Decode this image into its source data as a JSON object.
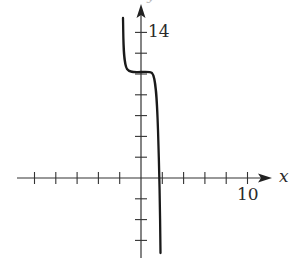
{
  "chart_data": {
    "type": "line",
    "title": "",
    "xlabel": "x",
    "ylabel": "y",
    "xlim": [
      -12,
      12
    ],
    "ylim": [
      -8,
      16
    ],
    "x_tick_step": 2,
    "y_tick_step": 2,
    "labeled_ticks": {
      "x": [
        10
      ],
      "y": [
        14
      ]
    },
    "grid": false,
    "legend": null,
    "series": [
      {
        "name": "curve",
        "description": "decreasing cubic-like curve with a horizontal plateau (inflection) near y=10, crossing the x-axis near x=2",
        "points": [
          {
            "x": -1.6,
            "y": 15.5
          },
          {
            "x": -1.5,
            "y": 12.0
          },
          {
            "x": -1.2,
            "y": 10.4
          },
          {
            "x": -0.5,
            "y": 10.1
          },
          {
            "x": 0.5,
            "y": 10.0
          },
          {
            "x": 1.0,
            "y": 9.9
          },
          {
            "x": 1.3,
            "y": 8.0
          },
          {
            "x": 1.6,
            "y": 4.0
          },
          {
            "x": 1.8,
            "y": 0.0
          },
          {
            "x": 1.9,
            "y": -4.0
          },
          {
            "x": 2.0,
            "y": -7.3
          }
        ]
      }
    ]
  },
  "labels": {
    "x_axis": "x",
    "y_axis": "y",
    "x_tick_10": "10",
    "y_tick_14": "14"
  }
}
